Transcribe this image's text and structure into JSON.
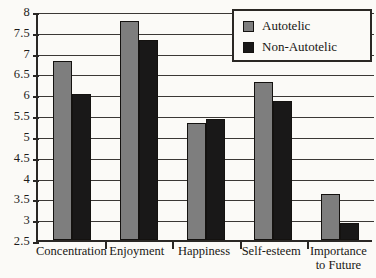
{
  "chart_data": {
    "type": "bar",
    "title": "",
    "xlabel": "",
    "ylabel": "",
    "ylim": [
      2.5,
      8
    ],
    "grid": true,
    "legend_position": "top-right",
    "categories": [
      "Concentration",
      "Enjoyment",
      "Happiness",
      "Self-esteem",
      "Importance to Future"
    ],
    "category_lines": [
      [
        "Concentration"
      ],
      [
        "Enjoyment"
      ],
      [
        "Happiness"
      ],
      [
        "Self-esteem"
      ],
      [
        "Importance",
        "to Future"
      ]
    ],
    "ytick_labels": [
      "8",
      "7.5",
      "7",
      "6.5",
      "6",
      "5.5",
      "5",
      "4.5",
      "4",
      "3.5",
      "3",
      "2.5"
    ],
    "ytick_values": [
      8,
      7.5,
      7,
      6.5,
      6,
      5.5,
      5,
      4.5,
      4,
      3.5,
      3,
      2.5
    ],
    "series": [
      {
        "name": "Autotelic",
        "color": "#7e7e7e",
        "values": [
          6.8,
          7.75,
          5.3,
          6.3,
          3.6
        ]
      },
      {
        "name": "Non-Autotelic",
        "color": "#191818",
        "values": [
          6.0,
          7.3,
          5.4,
          5.85,
          2.9
        ]
      }
    ]
  },
  "legend": {
    "items": [
      {
        "label": "Autotelic",
        "color": "#7e7e7e"
      },
      {
        "label": "Non-Autotelic",
        "color": "#191818"
      }
    ]
  },
  "axis": {
    "y_min_label": "2.5",
    "y_max_label": "8"
  }
}
